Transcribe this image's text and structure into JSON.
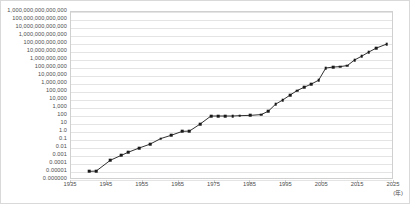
{
  "figure": {
    "cropped_title_fragment": "",
    "axis_title_x": "(年)",
    "border_color": "#d9d9d9",
    "gridline_color": "#e4e4e4",
    "series_color": "#1a1a1a"
  },
  "chart_data": {
    "type": "line",
    "title": "",
    "subtitle": "",
    "xlabel": "(年)",
    "ylabel": "",
    "yscale": "log",
    "grid": true,
    "legend": "none",
    "xlim": [
      1935,
      2025
    ],
    "ylim": [
      1e-06,
      1000000000000000.0
    ],
    "xticks": [
      1935,
      1945,
      1955,
      1965,
      1975,
      1985,
      1995,
      2005,
      2015,
      2025
    ],
    "xtick_labels": [
      "1935",
      "1945",
      "1955",
      "1965",
      "1975",
      "1985",
      "1995",
      "2005",
      "2015",
      "2025"
    ],
    "ytick_labels": [
      "1,000,000,000,000,000",
      "100,000,000,000,000",
      "10,000,000,000,000",
      "1,000,000,000,000",
      "100,000,000,000",
      "10,000,000,000",
      "1,000,000,000",
      "100,000,000",
      "10,000,000",
      "1,000,000",
      "100,000",
      "10,000",
      "1,000",
      "100",
      "10",
      "1.0",
      "0.1",
      "0.01",
      "0.001",
      "0.0001",
      "0.00001",
      "0.000000"
    ],
    "ytick_values": [
      1000000000000000.0,
      100000000000000.0,
      10000000000000.0,
      1000000000000.0,
      100000000000.0,
      10000000000.0,
      1000000000.0,
      100000000.0,
      10000000.0,
      1000000.0,
      100000.0,
      10000.0,
      1000.0,
      100.0,
      10.0,
      1.0,
      0.1,
      0.01,
      0.001,
      0.0001,
      1e-05,
      1e-06
    ],
    "x": [
      1940,
      1942,
      1946,
      1949,
      1951,
      1954,
      1957,
      1960,
      1963,
      1966,
      1968,
      1971,
      1974,
      1976,
      1978,
      1980,
      1982,
      1985,
      1988,
      1990,
      1992,
      1994,
      1996,
      1998,
      2000,
      2002,
      2004,
      2006,
      2008,
      2010,
      2012,
      2014,
      2016,
      2018,
      2020,
      2023
    ],
    "y": [
      1.2e-05,
      1.3e-05,
      0.0003,
      0.0012,
      0.003,
      0.01,
      0.03,
      0.15,
      0.4,
      1.2,
      1.3,
      10.0,
      100.0,
      100.0,
      100.0,
      100.0,
      110.0,
      120.0,
      150.0,
      400.0,
      3000.0,
      10000.0,
      40000.0,
      150000.0,
      400000.0,
      1000000.0,
      3000000.0,
      100000000.0,
      130000000.0,
      150000000.0,
      200000000.0,
      1000000000.0,
      3000000000.0,
      10000000000.0,
      30000000000.0,
      100000000000.0
    ]
  }
}
